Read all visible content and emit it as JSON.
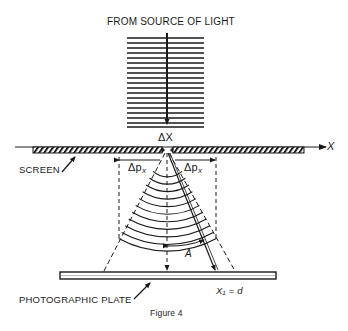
{
  "figure": {
    "title": "FROM SOURCE OF LIGHT",
    "caption": "Figure 4",
    "labels": {
      "slit_width": "ΔX",
      "axis": "X",
      "screen": "SCREEN",
      "momentum_left": "Δp",
      "momentum_left_sub": "x",
      "momentum_right": "Δp",
      "momentum_right_sub": "x",
      "angle": "A",
      "plate_position": "X₁ = d",
      "plate": "PHOTOGRAPHIC PLATE"
    },
    "colors": {
      "ink": "#1a1a1a",
      "background": "#ffffff"
    }
  }
}
